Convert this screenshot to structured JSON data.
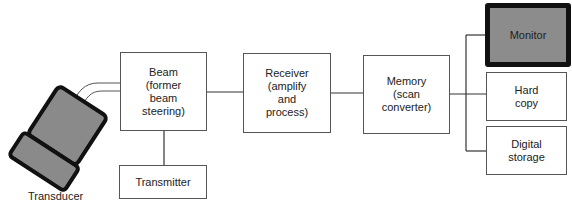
{
  "diagram": {
    "transducer": {
      "label": "Transducer"
    },
    "blocks": {
      "beam": {
        "label": "Beam\n(former\nbeam\nsteering)"
      },
      "transmitter": {
        "label": "Transmitter"
      },
      "receiver": {
        "label": "Receiver\n(amplify\nand\nprocess)"
      },
      "memory": {
        "label": "Memory\n(scan\nconverter)"
      },
      "monitor": {
        "label": "Monitor"
      },
      "hard_copy": {
        "label": "Hard\ncopy"
      },
      "digital_storage": {
        "label": "Digital\nstorage"
      }
    },
    "colors": {
      "line": "#333333",
      "monitor_fill": "#8c8c8c",
      "transducer_fill": "#8a8a8a",
      "outline_dark": "#111111"
    }
  }
}
